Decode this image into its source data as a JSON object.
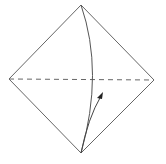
{
  "diagram": {
    "type": "origami-fold-step",
    "shape": "square-diamond",
    "vertices": {
      "top": [
        81,
        5
      ],
      "right": [
        154,
        80
      ],
      "bottom": [
        81,
        153
      ],
      "left": [
        9,
        79
      ]
    },
    "fold_line": {
      "style": "valley-dashed",
      "from": [
        9,
        79
      ],
      "to": [
        154,
        80
      ]
    },
    "crease_curve": {
      "from": [
        81,
        5
      ],
      "control": [
        100,
        70
      ],
      "to": [
        81,
        153
      ]
    },
    "arrow": {
      "from": [
        81,
        153
      ],
      "control": [
        88,
        120
      ],
      "to": [
        102,
        94
      ],
      "meaning": "fold bottom corner up"
    },
    "colors": {
      "stroke": "#555555",
      "background": "#ffffff"
    }
  }
}
